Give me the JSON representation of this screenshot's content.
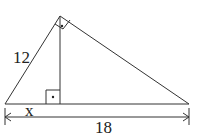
{
  "diagram": {
    "type": "right-triangle-altitude",
    "labels": {
      "hypotenuse_leg": "12",
      "segment": "x",
      "base": "18"
    },
    "colors": {
      "stroke": "#333333",
      "background": "#ffffff"
    },
    "marks": [
      "right-angle-at-apex",
      "right-angle-at-altitude-foot"
    ]
  }
}
